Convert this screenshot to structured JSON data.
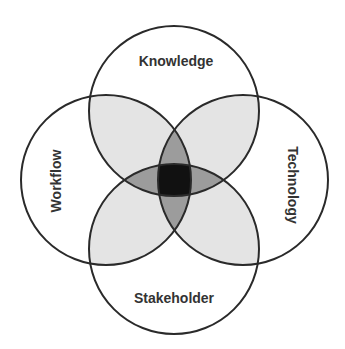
{
  "diagram": {
    "type": "venn",
    "sets": [
      {
        "id": "knowledge",
        "label": "Knowledge",
        "position": "top"
      },
      {
        "id": "workflow",
        "label": "Workflow",
        "position": "left"
      },
      {
        "id": "technology",
        "label": "Technology",
        "position": "right"
      },
      {
        "id": "stakeholder",
        "label": "Stakeholder",
        "position": "bottom"
      }
    ],
    "colors": {
      "background": "#ffffff",
      "outline": "#2a2a2a",
      "pair_overlap": "#e4e4e4",
      "triple_overlap": "#9c9c9c",
      "all_overlap": "#111111",
      "text": "#333333"
    }
  }
}
